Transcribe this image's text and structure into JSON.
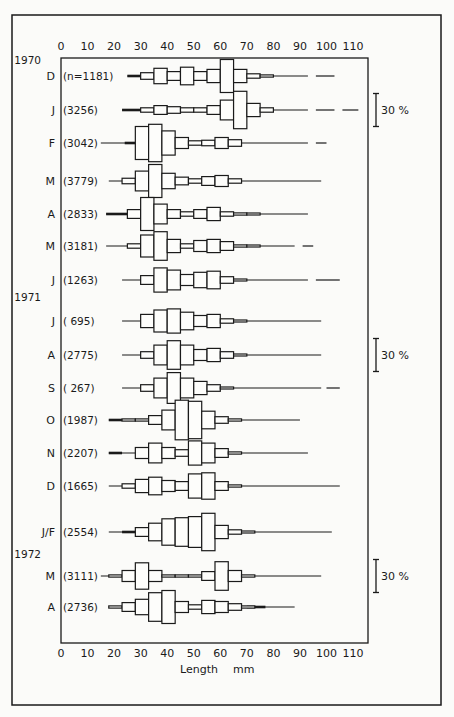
{
  "chart_data": {
    "type": "histogram-series",
    "title": "",
    "xlabel": "Length",
    "xunit": "mm",
    "xlim": [
      0,
      115
    ],
    "x_ticks": [
      0,
      10,
      20,
      30,
      40,
      50,
      60,
      70,
      80,
      90,
      100,
      110
    ],
    "bin_width_mm": 5,
    "scale_bar": {
      "label": "30 %",
      "value": 30
    },
    "scale_bar_rows": [
      1,
      8,
      14
    ],
    "rows": [
      {
        "year": "1970",
        "month": "D",
        "n": "(n=1181)",
        "line": [
          25,
          93
        ],
        "thick": [
          25,
          30
        ],
        "dashes": [
          [
            96,
            103
          ]
        ],
        "bins": [
          [
            30,
            6
          ],
          [
            35,
            14
          ],
          [
            40,
            8
          ],
          [
            45,
            16
          ],
          [
            50,
            8
          ],
          [
            55,
            12
          ],
          [
            60,
            30
          ],
          [
            65,
            12
          ],
          [
            70,
            4
          ],
          [
            75,
            2
          ]
        ]
      },
      {
        "month": "J",
        "n": "(3256)",
        "line": [
          23,
          93
        ],
        "thick": [
          23,
          30
        ],
        "dashes": [
          [
            96,
            103
          ],
          [
            106,
            112
          ]
        ],
        "bins": [
          [
            30,
            4
          ],
          [
            35,
            8
          ],
          [
            40,
            6
          ],
          [
            45,
            4
          ],
          [
            50,
            4
          ],
          [
            55,
            8
          ],
          [
            60,
            18
          ],
          [
            65,
            34
          ],
          [
            70,
            12
          ],
          [
            75,
            4
          ]
        ]
      },
      {
        "month": "F",
        "n": "(3042)",
        "line": [
          15,
          93
        ],
        "thick": [
          24,
          28
        ],
        "dashes": [
          [
            96,
            100
          ]
        ],
        "bins": [
          [
            28,
            30
          ],
          [
            33,
            34
          ],
          [
            38,
            22
          ],
          [
            43,
            10
          ],
          [
            48,
            4
          ],
          [
            53,
            5
          ],
          [
            58,
            10
          ],
          [
            63,
            6
          ]
        ]
      },
      {
        "month": "M",
        "n": "(3779)",
        "line": [
          18,
          98
        ],
        "thick": [],
        "dashes": [],
        "bins": [
          [
            23,
            5
          ],
          [
            28,
            18
          ],
          [
            33,
            30
          ],
          [
            38,
            14
          ],
          [
            43,
            7
          ],
          [
            48,
            4
          ],
          [
            53,
            8
          ],
          [
            58,
            10
          ],
          [
            63,
            4
          ]
        ]
      },
      {
        "month": "A",
        "n": "(2833)",
        "line": [
          17,
          93
        ],
        "thick": [
          17,
          25
        ],
        "dashes": [],
        "bins": [
          [
            25,
            8
          ],
          [
            30,
            30
          ],
          [
            35,
            18
          ],
          [
            40,
            8
          ],
          [
            45,
            4
          ],
          [
            50,
            8
          ],
          [
            55,
            12
          ],
          [
            60,
            4
          ]
        ],
        "tail": [
          [
            65,
            2
          ],
          [
            70,
            1
          ]
        ]
      },
      {
        "month": "M",
        "n": "(3181)",
        "line": [
          17,
          88
        ],
        "thick": [],
        "dashes": [
          [
            91,
            95
          ]
        ],
        "bins": [
          [
            25,
            4
          ],
          [
            30,
            20
          ],
          [
            35,
            26
          ],
          [
            40,
            12
          ],
          [
            45,
            4
          ],
          [
            50,
            10
          ],
          [
            55,
            12
          ],
          [
            60,
            8
          ]
        ],
        "tail": [
          [
            65,
            2
          ],
          [
            70,
            1
          ]
        ]
      },
      {
        "month": "J",
        "n": "(1263)",
        "line": [
          23,
          93
        ],
        "thick": [],
        "dashes": [
          [
            96,
            105
          ]
        ],
        "bins": [
          [
            30,
            8
          ],
          [
            35,
            22
          ],
          [
            40,
            18
          ],
          [
            45,
            10
          ],
          [
            50,
            14
          ],
          [
            55,
            16
          ],
          [
            60,
            6
          ]
        ],
        "tail": [
          [
            65,
            1
          ]
        ]
      },
      {
        "year": "1971",
        "month": "J",
        "n": "( 695)",
        "line": [
          23,
          98
        ],
        "thick": [],
        "dashes": [],
        "bins": [
          [
            30,
            12
          ],
          [
            35,
            20
          ],
          [
            40,
            22
          ],
          [
            45,
            16
          ],
          [
            50,
            10
          ],
          [
            55,
            12
          ],
          [
            60,
            4
          ]
        ],
        "tail": [
          [
            65,
            1
          ]
        ]
      },
      {
        "month": "A",
        "n": "(2775)",
        "line": [
          23,
          98
        ],
        "thick": [],
        "dashes": [],
        "bins": [
          [
            30,
            6
          ],
          [
            35,
            18
          ],
          [
            40,
            26
          ],
          [
            45,
            18
          ],
          [
            50,
            10
          ],
          [
            55,
            12
          ],
          [
            60,
            6
          ]
        ],
        "tail": [
          [
            65,
            1
          ]
        ]
      },
      {
        "month": "S",
        "n": "( 267)",
        "line": [
          23,
          98
        ],
        "thick": [],
        "dashes": [
          [
            100,
            105
          ]
        ],
        "bins": [
          [
            30,
            6
          ],
          [
            35,
            18
          ],
          [
            40,
            28
          ],
          [
            45,
            18
          ],
          [
            50,
            12
          ],
          [
            55,
            6
          ]
        ],
        "tail": [
          [
            60,
            1
          ]
        ]
      },
      {
        "month": "O",
        "n": "(1987)",
        "line": [
          18,
          90
        ],
        "thick": [
          18,
          23
        ],
        "dashes": [],
        "bins": [
          [
            23,
            2
          ],
          [
            28,
            2
          ],
          [
            33,
            8
          ],
          [
            38,
            18
          ],
          [
            43,
            36
          ],
          [
            48,
            34
          ],
          [
            53,
            16
          ],
          [
            58,
            6
          ],
          [
            63,
            2
          ]
        ]
      },
      {
        "month": "N",
        "n": "(2207)",
        "line": [
          18,
          93
        ],
        "thick": [
          18,
          23
        ],
        "dashes": [],
        "bins": [
          [
            28,
            10
          ],
          [
            33,
            18
          ],
          [
            38,
            10
          ],
          [
            43,
            6
          ],
          [
            48,
            22
          ],
          [
            53,
            18
          ],
          [
            58,
            8
          ]
        ],
        "tail": [
          [
            63,
            2
          ]
        ]
      },
      {
        "month": "D",
        "n": "(1665)",
        "line": [
          18,
          105
        ],
        "thick": [],
        "dashes": [],
        "bins": [
          [
            23,
            4
          ],
          [
            28,
            12
          ],
          [
            33,
            16
          ],
          [
            38,
            10
          ],
          [
            43,
            8
          ],
          [
            48,
            22
          ],
          [
            53,
            24
          ],
          [
            58,
            8
          ]
        ],
        "tail": [
          [
            63,
            2
          ]
        ]
      },
      {
        "month": "J/F",
        "n": "(2554)",
        "line": [
          18,
          102
        ],
        "thick": [
          23,
          28
        ],
        "dashes": [],
        "bins": [
          [
            28,
            8
          ],
          [
            33,
            16
          ],
          [
            38,
            24
          ],
          [
            43,
            26
          ],
          [
            48,
            28
          ],
          [
            53,
            34
          ],
          [
            58,
            12
          ],
          [
            63,
            4
          ]
        ],
        "tail": [
          [
            68,
            1
          ]
        ]
      },
      {
        "year": "1972",
        "month": "M",
        "n": "(3111)",
        "line": [
          15,
          98
        ],
        "thick": [],
        "dashes": [],
        "bins": [
          [
            18,
            2
          ],
          [
            23,
            10
          ],
          [
            28,
            24
          ],
          [
            33,
            10
          ],
          [
            38,
            2
          ],
          [
            43,
            2
          ],
          [
            48,
            2
          ],
          [
            53,
            8
          ],
          [
            58,
            26
          ],
          [
            63,
            10
          ],
          [
            68,
            2
          ]
        ]
      },
      {
        "month": "A",
        "n": "(2736)",
        "line": [
          18,
          88
        ],
        "thick": [
          70,
          77
        ],
        "dashes": [],
        "bins": [
          [
            18,
            2
          ],
          [
            23,
            8
          ],
          [
            28,
            14
          ],
          [
            33,
            26
          ],
          [
            38,
            30
          ],
          [
            43,
            10
          ],
          [
            48,
            4
          ],
          [
            53,
            12
          ],
          [
            58,
            10
          ],
          [
            63,
            6
          ],
          [
            68,
            2
          ]
        ]
      }
    ]
  }
}
